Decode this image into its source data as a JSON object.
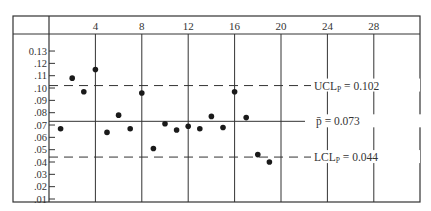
{
  "chart_data": {
    "type": "scatter",
    "xlabel": "",
    "ylabel": "",
    "x_ticks": [
      4,
      8,
      12,
      16,
      20,
      24,
      28
    ],
    "y_ticks": [
      "0.13",
      ".12",
      ".11",
      ".10",
      ".09",
      ".08",
      ".07",
      ".06",
      ".05",
      ".04",
      ".03",
      ".02",
      ".01"
    ],
    "xlim": [
      0,
      32
    ],
    "ylim": [
      0,
      0.14
    ],
    "grid": "vertical lines at x ticks",
    "series": [
      {
        "name": "sample proportion",
        "x": [
          1,
          2,
          3,
          4,
          5,
          6,
          7,
          8,
          9,
          10,
          11,
          12,
          13,
          14,
          15,
          16,
          17,
          18,
          19
        ],
        "values": [
          0.067,
          0.108,
          0.097,
          0.115,
          0.064,
          0.078,
          0.067,
          0.096,
          0.051,
          0.071,
          0.066,
          0.069,
          0.067,
          0.077,
          0.068,
          0.097,
          0.076,
          0.046,
          0.04
        ]
      }
    ],
    "reference_lines": [
      {
        "name": "UCL",
        "value": 0.102,
        "style": "dashed",
        "label_main": "UCL",
        "label_sub": "P",
        "label_value": "= 0.102"
      },
      {
        "name": "center",
        "value": 0.073,
        "style": "solid",
        "label_main": "p̄",
        "label_sub": "",
        "label_value": "= 0.073"
      },
      {
        "name": "LCL",
        "value": 0.044,
        "style": "dashed",
        "label_main": "LCL",
        "label_sub": "P",
        "label_value": "= 0.044"
      }
    ]
  }
}
